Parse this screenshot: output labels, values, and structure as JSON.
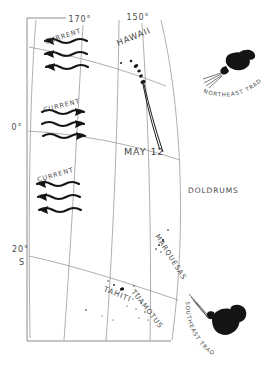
{
  "map": {
    "title": "Pacific Ocean Voyage Chart",
    "background_color": "#ffffff",
    "ink_color": "#1a1a1a",
    "graticule_color": "#8d8d8d",
    "text_color": "#4a4a4a"
  },
  "graticule": {
    "longitude_labels": [
      {
        "id": "lon-170",
        "text": "170°",
        "x": 80,
        "y": 22
      },
      {
        "id": "lon-150",
        "text": "150°",
        "x": 138,
        "y": 20
      }
    ],
    "latitude_labels": [
      {
        "id": "lat-0",
        "text": "0°",
        "x": 17,
        "y": 130
      },
      {
        "id": "lat-20s-deg",
        "text": "20°",
        "x": 12,
        "y": 252
      },
      {
        "id": "lat-20s-hem",
        "text": "S",
        "x": 19,
        "y": 265
      }
    ]
  },
  "places": [
    {
      "id": "hawaii",
      "label": "HAWAII",
      "x": 118,
      "y": 46,
      "rotate": -22
    },
    {
      "id": "marquesas",
      "label": "MARQUESAS",
      "x": 155,
      "y": 236,
      "rotate": 58
    },
    {
      "id": "tahiti",
      "label": "TAHITI",
      "x": 103,
      "y": 291,
      "rotate": 22
    },
    {
      "id": "tuamotus",
      "label": "TUAMOTUS",
      "x": 131,
      "y": 292,
      "rotate": 52
    }
  ],
  "annotations": [
    {
      "id": "may-12",
      "label": "MAY 12",
      "x": 124,
      "y": 155,
      "rotate": 0
    },
    {
      "id": "doldrums",
      "label": "DOLDRUMS",
      "x": 188,
      "y": 193,
      "rotate": 0
    }
  ],
  "currents": [
    {
      "id": "north-equatorial-current",
      "label": "CURRENT",
      "direction": "west",
      "label_x": 46,
      "label_y": 44,
      "label_rotate": -18,
      "arrow_count": 3
    },
    {
      "id": "equatorial-countercurrent",
      "label": "CURRENT",
      "direction": "east",
      "label_x": 44,
      "label_y": 112,
      "label_rotate": -14,
      "arrow_count": 3
    },
    {
      "id": "south-equatorial-current",
      "label": "CURRENT",
      "direction": "west",
      "label_x": 38,
      "label_y": 182,
      "label_rotate": -16,
      "arrow_count": 3
    }
  ],
  "winds": [
    {
      "id": "northeast-trades",
      "label": "NORTHEAST TRADES",
      "face_x": 231,
      "face_y": 63,
      "label_rotate": 30
    },
    {
      "id": "southeast-trades",
      "label": "SOUTHEAST TRADES",
      "face_x": 218,
      "face_y": 323,
      "label_rotate": 52
    }
  ],
  "voyage_track": {
    "id": "voyage-track",
    "start_place": "HAWAII",
    "date_marker": "MAY 12"
  }
}
